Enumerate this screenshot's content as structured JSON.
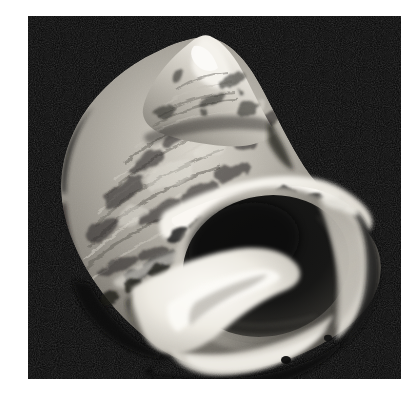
{
  "page": {
    "background_color": "#ffffff",
    "width": 418,
    "height": 402
  },
  "photo": {
    "subject": "gastropod-sea-snail-shell",
    "description": "Black and white photograph of a marine snail shell viewed from the aperture side, apex pointing up and slightly right",
    "color_mode": "grayscale",
    "background_color": "#050505",
    "frame": {
      "left": 28,
      "top": 16,
      "width": 373,
      "height": 363
    },
    "highlight_color": "#f2f0ea",
    "midtone_color": "#9a968e",
    "shadow_color": "#141414",
    "aperture_color": "#0d0d0d",
    "parts": [
      {
        "name": "apex-spire",
        "label": "Apex / spire"
      },
      {
        "name": "body-whorl",
        "label": "Body whorl"
      },
      {
        "name": "shoulder-band",
        "label": "White shoulder band with dark blotches"
      },
      {
        "name": "aperture",
        "label": "Aperture opening"
      },
      {
        "name": "outer-lip",
        "label": "Outer lip"
      },
      {
        "name": "columella",
        "label": "Columella / parietal callus"
      },
      {
        "name": "siphonal-area",
        "label": "Anterior basal edge"
      }
    ]
  }
}
